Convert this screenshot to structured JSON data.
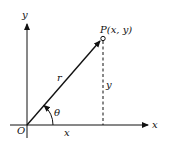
{
  "diagram": {
    "labels": {
      "y_axis": "y",
      "x_axis": "x",
      "origin": "O",
      "point": "P(x, y)",
      "radius": "r",
      "vertical_leg": "y",
      "horizontal_leg": "x",
      "angle": "θ"
    },
    "colors": {
      "stroke": "#111111",
      "background": "#ffffff"
    }
  }
}
